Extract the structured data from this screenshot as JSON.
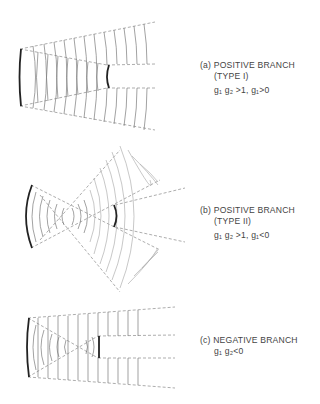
{
  "figures": [
    {
      "id": "a",
      "tag": "(a)",
      "title": "POSITIVE BRANCH",
      "subtitle": "(TYPE I)",
      "condition": "g₁ g₂ >1, g₁>0"
    },
    {
      "id": "b",
      "tag": "(b)",
      "title": "POSITIVE BRANCH",
      "subtitle": "(TYPE II)",
      "condition": "g₁ g₂ >1, g₁<0"
    },
    {
      "id": "c",
      "tag": "(c)",
      "title": "NEGATIVE BRANCH",
      "subtitle": "",
      "condition": "g₁ g₂<0"
    }
  ],
  "colors": {
    "mirror": "#222222",
    "wavefront": "#7a7a7a",
    "ray": "#8a8a8a",
    "text": "#444444"
  }
}
